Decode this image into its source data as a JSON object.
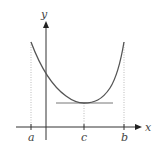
{
  "diagram": {
    "axes": {
      "x_label": "x",
      "y_label": "y"
    },
    "tick_labels": {
      "a": "a",
      "c": "c",
      "b": "b"
    },
    "colors": {
      "axis": "#333333",
      "curve": "#555555",
      "tangent": "#777777",
      "dotted_guides": "#aaaaaa"
    },
    "geometry": {
      "origin_px": [
        46,
        127
      ],
      "x_a_px": 31,
      "x_c_px": 84,
      "x_b_px": 124,
      "curve_endpoints_y_px": 42,
      "minimum_y_px": 103,
      "tangent_x_range_px": [
        56,
        113
      ]
    }
  }
}
